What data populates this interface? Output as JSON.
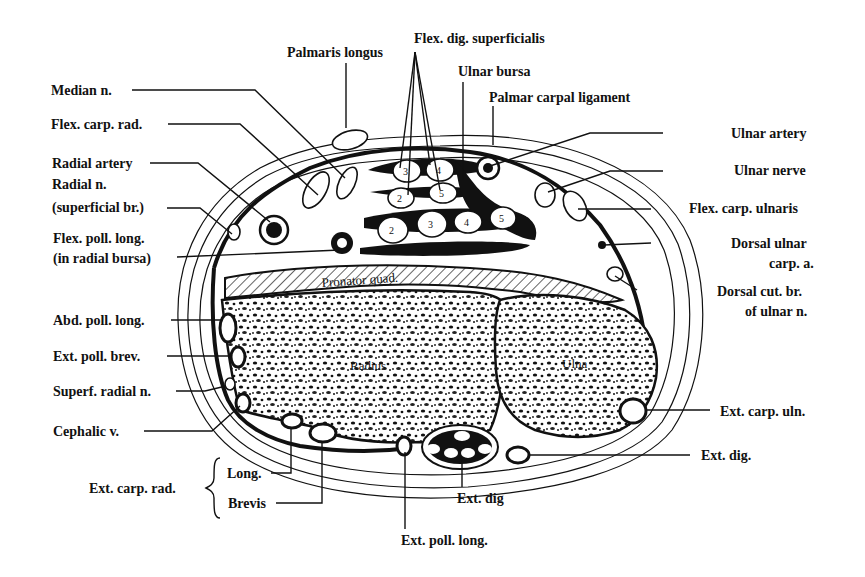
{
  "figure": {
    "labels": {
      "palmaris_longus": "Palmaris longus",
      "flex_dig_superficialis": "Flex. dig. superficialis",
      "ulnar_bursa": "Ulnar bursa",
      "palmar_carpal_ligament": "Palmar carpal ligament",
      "median_n": "Median n.",
      "flex_carp_rad": "Flex. carp. rad.",
      "radial_artery": "Radial artery",
      "radial_n_line1": "Radial n.",
      "radial_n_line2": "(superficial br.)",
      "flex_poll_long_line1": "Flex. poll. long.",
      "flex_poll_long_line2": "(in radial bursa)",
      "abd_poll_long": "Abd. poll. long.",
      "ext_poll_brev": "Ext. poll. brev.",
      "superf_radial_n": "Superf. radial n.",
      "cephalic_v": "Cephalic v.",
      "ext_carp_rad": "Ext. carp. rad.",
      "ext_carp_rad_long": "Long.",
      "ext_carp_rad_brevis": "Brevis",
      "ext_poll_long": "Ext. poll. long.",
      "ext_dig_center": "Ext. dig",
      "ext_dig": "Ext. dig.",
      "ext_carp_uln": "Ext. carp. uln.",
      "ulnar_artery": "Ulnar artery",
      "ulnar_nerve": "Ulnar nerve",
      "flex_carp_ulnaris": "Flex. carp. ulnaris",
      "dorsal_ulnar_carp_a_line1": "Dorsal ulnar",
      "dorsal_ulnar_carp_a_line2": "carp. a.",
      "dorsal_cut_br_line1": "Dorsal cut. br.",
      "dorsal_cut_br_line2": "of ulnar n."
    },
    "inner_labels": {
      "pronator_quad": "Pronator quad.",
      "radius": "Radius",
      "ulna": "Ulna"
    },
    "tendon_numbers": {
      "superficial_row1": [
        "3",
        "4"
      ],
      "superficial_row2": [
        "2",
        "5"
      ],
      "profundus_row": [
        "2",
        "3",
        "4",
        "5"
      ]
    }
  }
}
